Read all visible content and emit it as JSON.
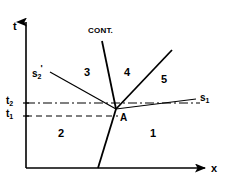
{
  "figure": {
    "type": "phase-diagram",
    "background_color": "#ffffff",
    "line_color": "#000000",
    "width": 230,
    "height": 183
  },
  "axes": {
    "y_label": "t",
    "x_label": "x",
    "y_axis_x": 26,
    "x_axis_y": 168,
    "y_axis_top": 14,
    "x_axis_right": 214
  },
  "ticks": [
    {
      "id": "t2",
      "base": "t",
      "subscript": "2",
      "value_y": 103,
      "line_style": "dash-dot"
    },
    {
      "id": "t1",
      "base": "t",
      "subscript": "1",
      "value_y": 116,
      "line_style": "dashed"
    }
  ],
  "invariant_point": {
    "label": "A",
    "x": 116,
    "y": 109
  },
  "curves": [
    {
      "name": "cont",
      "label": "CONT.",
      "style": "solid",
      "description": "steep near-vertical boundary through A"
    },
    {
      "name": "s2-prime",
      "label_base": "s",
      "label_subscript": "2",
      "label_prime": "'",
      "style": "solid",
      "description": "descending line from upper-left to A"
    },
    {
      "name": "s1",
      "label_base": "s",
      "label_subscript": "1",
      "label_prime": "",
      "style": "solid",
      "description": "gently rising line from A to the right"
    },
    {
      "name": "divider-4-5",
      "label": "",
      "style": "solid",
      "description": "steeply rising line from A to upper right separating regions 4 and 5"
    }
  ],
  "regions": [
    {
      "label": "1",
      "x": 152,
      "y": 133
    },
    {
      "label": "2",
      "x": 60,
      "y": 133
    },
    {
      "label": "3",
      "x": 86,
      "y": 73
    },
    {
      "label": "4",
      "x": 126,
      "y": 73
    },
    {
      "label": "5",
      "x": 163,
      "y": 79
    }
  ],
  "labels": {
    "cont": "CONT.",
    "point_a": "A",
    "y_axis": "t",
    "x_axis": "x",
    "s_base": "s",
    "sub_1": "1",
    "sub_2": "2",
    "prime": "'",
    "tick_t_base": "t",
    "region_1": "1",
    "region_2": "2",
    "region_3": "3",
    "region_4": "4",
    "region_5": "5"
  }
}
